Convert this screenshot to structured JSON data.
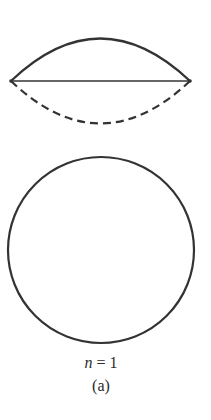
{
  "figure": {
    "label": "(a)",
    "equation": {
      "variable": "n",
      "operator": "=",
      "value": "1"
    },
    "standing_wave": {
      "description": "String fixed at both ends, fundamental mode; solid arc = one extreme, dashed arc = opposite extreme, straight line = equilibrium",
      "left_end": [
        11,
        81
      ],
      "right_end": [
        190,
        81
      ],
      "crest_y": 38,
      "trough_y": 124
    },
    "circle": {
      "description": "Circular standing wave (ring) for n = 1",
      "center": [
        101,
        250
      ],
      "radius": 93
    },
    "colors": {
      "stroke": "#333333",
      "background": "#ffffff"
    }
  }
}
